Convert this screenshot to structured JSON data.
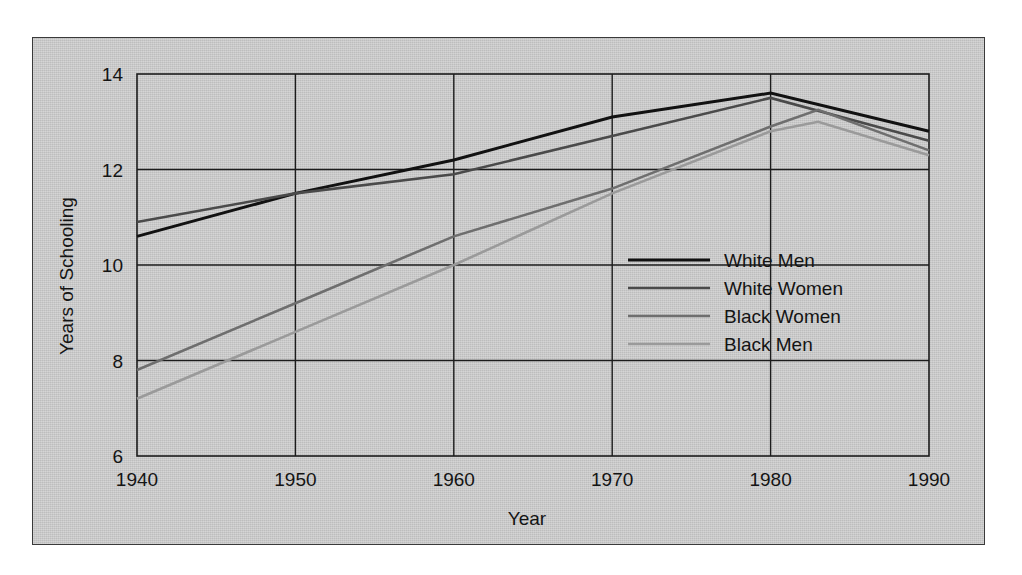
{
  "figure": {
    "background_color": "#ffffff",
    "panel_color": "#c9c9c9",
    "panel_border_color": "#3a3a3a",
    "axis_color": "#1c1c1c"
  },
  "chart_data": {
    "type": "line",
    "title": "",
    "subtitle": "",
    "xlabel": "Year",
    "ylabel": "Years of Schooling",
    "xlim": [
      1940,
      1990
    ],
    "ylim": [
      6,
      14
    ],
    "xticks": [
      1940,
      1950,
      1960,
      1970,
      1980,
      1990
    ],
    "xticklabels": [
      "1940",
      "1950",
      "1960",
      "1970",
      "1980",
      "1990"
    ],
    "yticks": [
      6,
      8,
      10,
      12,
      14
    ],
    "yticklabels": [
      "6",
      "8",
      "10",
      "12",
      "14"
    ],
    "grid": true,
    "grid_axis": "both",
    "legend_position": "center right",
    "series": [
      {
        "name": "White Men",
        "color": "#111111",
        "width": 3.0,
        "x": [
          1940,
          1950,
          1960,
          1970,
          1980,
          1990
        ],
        "values": [
          10.6,
          11.5,
          12.2,
          13.1,
          13.6,
          12.8
        ]
      },
      {
        "name": "White Women",
        "color": "#4a4a4a",
        "width": 2.6,
        "x": [
          1940,
          1950,
          1960,
          1970,
          1980,
          1990
        ],
        "values": [
          10.9,
          11.5,
          11.9,
          12.7,
          13.5,
          12.6
        ]
      },
      {
        "name": "Black Women",
        "color": "#6e6e6e",
        "width": 2.6,
        "x": [
          1940,
          1950,
          1960,
          1970,
          1980,
          1983,
          1990
        ],
        "values": [
          7.8,
          9.2,
          10.6,
          11.6,
          12.9,
          13.25,
          12.4
        ]
      },
      {
        "name": "Black Men",
        "color": "#9a9a9a",
        "width": 2.6,
        "x": [
          1940,
          1950,
          1960,
          1970,
          1980,
          1983,
          1990
        ],
        "values": [
          7.2,
          8.6,
          10.0,
          11.5,
          12.8,
          13.0,
          12.3
        ]
      }
    ]
  }
}
